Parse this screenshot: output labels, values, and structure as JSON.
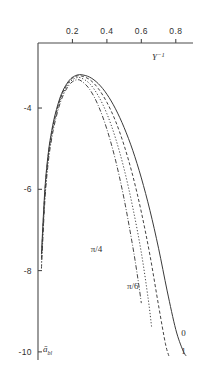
{
  "chart_data": {
    "type": "line",
    "title": "",
    "xlabel": "Y^-1",
    "ylabel": "a_bl",
    "xlabel_base": "Y",
    "xlabel_exp": "−1",
    "ylabel_base": "ā",
    "ylabel_sub": "bl",
    "xlim": [
      0.0,
      0.9
    ],
    "ylim": [
      -10.2,
      -2.4
    ],
    "xticks": [
      0.2,
      0.4,
      0.6,
      0.8
    ],
    "xtick_labels": [
      "0.2",
      "0.4",
      "0.6",
      "0.8"
    ],
    "yticks": [
      -4,
      -6,
      -8,
      -10
    ],
    "ytick_labels": [
      "-4",
      "-6",
      "-8",
      "-10"
    ],
    "grid": false,
    "axis_position": "x-top-y-left",
    "legend_position": "inline-curve-labels",
    "series": [
      {
        "name": "0",
        "label": "0",
        "style": "solid",
        "x": [
          0.02,
          0.04,
          0.06,
          0.08,
          0.1,
          0.13,
          0.16,
          0.19,
          0.22,
          0.25,
          0.3,
          0.35,
          0.4,
          0.45,
          0.5,
          0.55,
          0.6,
          0.65,
          0.7,
          0.75,
          0.8,
          0.84,
          0.86
        ],
        "y": [
          -7.6,
          -6.0,
          -5.1,
          -4.55,
          -4.15,
          -3.72,
          -3.45,
          -3.28,
          -3.2,
          -3.18,
          -3.24,
          -3.4,
          -3.66,
          -4.02,
          -4.48,
          -5.04,
          -5.72,
          -6.52,
          -7.45,
          -8.5,
          -9.45,
          -9.95,
          -10.1
        ]
      },
      {
        "name": "1",
        "label": "1",
        "style": "dashed",
        "x": [
          0.02,
          0.04,
          0.06,
          0.08,
          0.1,
          0.13,
          0.16,
          0.19,
          0.22,
          0.25,
          0.3,
          0.35,
          0.4,
          0.45,
          0.5,
          0.55,
          0.6,
          0.65,
          0.7,
          0.74,
          0.76
        ],
        "y": [
          -7.7,
          -6.08,
          -5.16,
          -4.6,
          -4.2,
          -3.76,
          -3.48,
          -3.3,
          -3.22,
          -3.21,
          -3.3,
          -3.52,
          -3.86,
          -4.32,
          -4.92,
          -5.66,
          -6.56,
          -7.62,
          -8.86,
          -9.8,
          -10.1
        ]
      },
      {
        "name": "pi/6",
        "label": "π/6",
        "style": "dotted",
        "x": [
          0.02,
          0.04,
          0.06,
          0.08,
          0.1,
          0.13,
          0.16,
          0.19,
          0.22,
          0.25,
          0.3,
          0.35,
          0.4,
          0.45,
          0.5,
          0.55,
          0.6,
          0.64,
          0.66
        ],
        "y": [
          -7.8,
          -6.16,
          -5.22,
          -4.66,
          -4.25,
          -3.8,
          -3.52,
          -3.34,
          -3.26,
          -3.26,
          -3.4,
          -3.7,
          -4.14,
          -4.74,
          -5.5,
          -6.44,
          -7.56,
          -8.7,
          -9.4
        ]
      },
      {
        "name": "pi/4",
        "label": "π/4",
        "style": "dashdot",
        "x": [
          0.02,
          0.04,
          0.06,
          0.08,
          0.1,
          0.13,
          0.16,
          0.19,
          0.22,
          0.25,
          0.3,
          0.35,
          0.4,
          0.45,
          0.5,
          0.55,
          0.58,
          0.6
        ],
        "y": [
          -7.95,
          -6.28,
          -5.32,
          -4.74,
          -4.32,
          -3.86,
          -3.57,
          -3.39,
          -3.31,
          -3.33,
          -3.54,
          -3.94,
          -4.52,
          -5.28,
          -6.24,
          -7.4,
          -8.2,
          -8.8
        ]
      }
    ],
    "annotations": [
      {
        "text": "π/4",
        "x": 0.34,
        "y": -7.55
      },
      {
        "text": "π/6",
        "x": 0.55,
        "y": -8.45
      },
      {
        "text": "0",
        "x": 0.845,
        "y": -9.62
      },
      {
        "text": "1",
        "x": 0.845,
        "y": -10.05
      }
    ]
  }
}
